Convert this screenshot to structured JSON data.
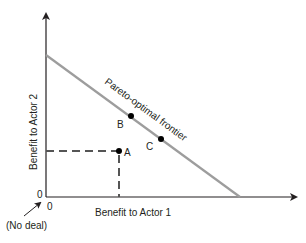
{
  "diagram": {
    "title": "Pareto-optimal frontier",
    "x_axis_label": "Benefit to Actor 1",
    "y_axis_label": "Benefit to Actor 2",
    "x_origin_label": "0",
    "y_origin_label": "0",
    "origin_annotation": "(No deal)",
    "frontier_label": "Pareto-optimal frontier",
    "points": [
      {
        "label": "A",
        "description": "Interior point (not Pareto-optimal)"
      },
      {
        "label": "B",
        "description": "Point on frontier"
      },
      {
        "label": "C",
        "description": "Point on frontier"
      }
    ],
    "colors": {
      "axis": "#231f20",
      "frontier": "#9d9d9d",
      "dashes": "#555555",
      "point": "#000000"
    }
  }
}
